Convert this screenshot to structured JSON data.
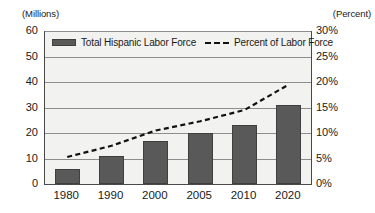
{
  "chart_data": {
    "type": "bar",
    "title": "",
    "subtitle": "",
    "categories": [
      "1980",
      "1990",
      "2000",
      "2005",
      "2010",
      "2020"
    ],
    "series": [
      {
        "name": "Total Hispanic Labor Force",
        "type": "bar",
        "axis": "left",
        "unit": "Millions",
        "color": "#595959",
        "values": [
          6,
          11,
          17,
          20,
          23,
          31
        ]
      },
      {
        "name": "Percent of Labor Force",
        "type": "line",
        "style": "dashed",
        "axis": "right",
        "unit": "Percent",
        "color": "#111111",
        "values": [
          5.3,
          7.5,
          10.5,
          12.3,
          14.5,
          19.5
        ]
      }
    ],
    "left_axis": {
      "caption": "(Millions)",
      "ticks": [
        "60",
        "50",
        "40",
        "30",
        "20",
        "10",
        "0"
      ],
      "tick_values": [
        60,
        50,
        40,
        30,
        20,
        10,
        0
      ],
      "ylim": [
        0,
        60
      ]
    },
    "right_axis": {
      "caption": "(Percent)",
      "ticks": [
        "30%",
        "25%",
        "20%",
        "15%",
        "10%",
        "5%",
        "0%"
      ],
      "tick_values": [
        30,
        25,
        20,
        15,
        10,
        5,
        0
      ],
      "ylim": [
        0,
        30
      ]
    },
    "xlabel": "",
    "grid": "horizontal",
    "legend_position": "top-inside",
    "plot_background": "#f2f2f0"
  },
  "legend": {
    "bar_entry_label": "Total Hispanic Labor Force",
    "line_entry_label": "Percent of Labor Force"
  }
}
